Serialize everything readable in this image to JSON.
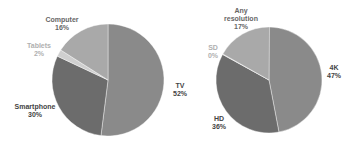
{
  "chart_data": [
    {
      "type": "pie",
      "title": "",
      "center": [
        108,
        80
      ],
      "radius": 56,
      "start_angle_deg": 0,
      "direction": "clockwise",
      "slices": [
        {
          "label": "TV",
          "value": 52,
          "pct_label": "52%",
          "color": "#8a8a8a",
          "label_pos": [
            180,
            82
          ],
          "label_color": "#444444"
        },
        {
          "label": "Smartphone",
          "value": 30,
          "pct_label": "30%",
          "color": "#6c6c6c",
          "label_pos": [
            35,
            103
          ],
          "label_color": "#444444"
        },
        {
          "label": "Tablets",
          "value": 2,
          "pct_label": "2%",
          "color": "#cfcfcf",
          "label_pos": [
            39,
            42
          ],
          "label_color": "#b0b0b0"
        },
        {
          "label": "Computer",
          "value": 16,
          "pct_label": "16%",
          "color": "#a9a9a9",
          "label_pos": [
            62,
            16
          ],
          "label_color": "#666666"
        }
      ]
    },
    {
      "type": "pie",
      "title": "",
      "center": [
        269,
        80
      ],
      "radius": 53,
      "start_angle_deg": 0,
      "direction": "clockwise",
      "slices": [
        {
          "label": "4K",
          "value": 47,
          "pct_label": "47%",
          "color": "#8a8a8a",
          "label_pos": [
            334,
            64
          ],
          "label_color": "#444444"
        },
        {
          "label": "HD",
          "value": 36,
          "pct_label": "36%",
          "color": "#6c6c6c",
          "label_pos": [
            219,
            115
          ],
          "label_color": "#444444"
        },
        {
          "label": "SD",
          "value": 0,
          "pct_label": "0%",
          "color": "#cfcfcf",
          "label_pos": [
            213,
            44
          ],
          "label_color": "#b0b0b0"
        },
        {
          "label": "Any resolution",
          "label_lines": [
            "Any",
            "resolution"
          ],
          "value": 17,
          "pct_label": "17%",
          "color": "#a9a9a9",
          "label_pos": [
            241,
            7
          ],
          "label_color": "#666666"
        }
      ]
    }
  ]
}
